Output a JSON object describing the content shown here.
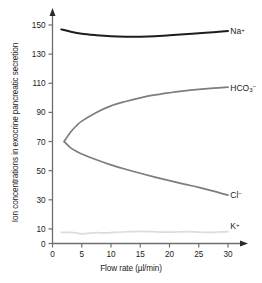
{
  "chart_data": {
    "type": "line",
    "title": "",
    "xlabel": "Flow rate (µl/min)",
    "ylabel": "Ion concentrations in exocrine pancreatic secretion",
    "xlim": [
      0,
      32
    ],
    "ylim": [
      0,
      155
    ],
    "xticks": [
      0,
      5,
      10,
      15,
      20,
      25,
      30
    ],
    "xtick_labels": [
      "0",
      "5",
      "10",
      "15",
      "20",
      "25",
      "30"
    ],
    "yticks": [
      0,
      10,
      30,
      50,
      70,
      90,
      110,
      130,
      150
    ],
    "ytick_labels": [
      "0",
      "10",
      "30",
      "50",
      "70",
      "90",
      "110",
      "130",
      "150"
    ],
    "grid": false,
    "legend_position": "right-inline",
    "series": [
      {
        "name": "Na⁺",
        "label_html": "Na<sup>+</sup>",
        "color": "#1d1d1d",
        "width": 2.0,
        "x": [
          1.5,
          3,
          5,
          7.5,
          10,
          12.5,
          15,
          17.5,
          20,
          22.5,
          25,
          27.5,
          30
        ],
        "values": [
          147,
          145.5,
          144,
          143,
          142.3,
          142,
          142,
          142.3,
          143,
          143.6,
          144.3,
          145,
          145.8
        ]
      },
      {
        "name": "HCO₃⁻",
        "label_html": "HCO<sub>3</sub><sup>−</sup>",
        "color": "#7d7d7d",
        "width": 1.7,
        "x": [
          2,
          3,
          4,
          5,
          7.5,
          10,
          12.5,
          15,
          17.5,
          20,
          22.5,
          25,
          27.5,
          30
        ],
        "values": [
          70,
          76,
          80.5,
          84,
          90,
          94.5,
          97.5,
          100,
          102,
          103.5,
          104.8,
          105.8,
          106.6,
          107.3
        ]
      },
      {
        "name": "Cl⁻",
        "label_html": "Cl<sup>−</sup>",
        "color": "#7d7d7d",
        "width": 1.7,
        "x": [
          2,
          3,
          4,
          5,
          7.5,
          10,
          12.5,
          15,
          17.5,
          20,
          22.5,
          25,
          27.5,
          30
        ],
        "values": [
          70,
          66,
          63.5,
          61.5,
          57.5,
          54,
          51,
          48.2,
          45.6,
          43.2,
          40.8,
          38.5,
          36,
          33.2
        ]
      },
      {
        "name": "K⁺",
        "label_html": "K<sup>+</sup>",
        "color": "#dcdcdc",
        "width": 1.7,
        "x": [
          1.5,
          3,
          4,
          5,
          6,
          7.5,
          9,
          10.5,
          12,
          13.5,
          15,
          17,
          19,
          21,
          23,
          25,
          27,
          28.5,
          30
        ],
        "values": [
          7.6,
          7.6,
          7.3,
          6.6,
          7.0,
          7.4,
          7.3,
          7.6,
          7.9,
          8.1,
          8.3,
          8.1,
          7.8,
          7.9,
          8.1,
          7.8,
          7.6,
          7.9,
          8.1
        ]
      }
    ],
    "series_label_anchors": [
      {
        "series": "Na⁺",
        "x": 30.4,
        "y": 146
      },
      {
        "series": "HCO₃⁻",
        "x": 30.4,
        "y": 107
      },
      {
        "series": "Cl⁻",
        "x": 30.4,
        "y": 33
      },
      {
        "series": "K⁺",
        "x": 30.4,
        "y": 12
      }
    ],
    "axis_color": "#6e6e6e",
    "text_color": "#1a1a1a"
  }
}
